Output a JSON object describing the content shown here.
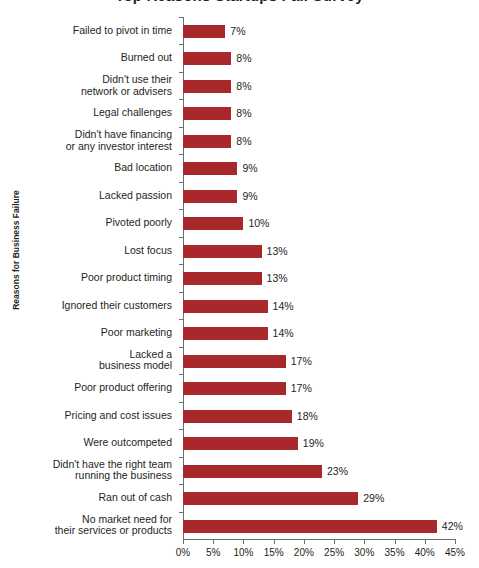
{
  "chart": {
    "title_fragment": "Top Reasons Startups Fail Survey",
    "y_axis_title": "Reasons for Business Failure",
    "bar_color": "#a8282b",
    "axis_color": "#6d6e71",
    "text_color": "#231f20"
  },
  "chart_data": {
    "type": "bar",
    "orientation": "horizontal",
    "title": "Top Reasons Startups Fail Survey",
    "xlabel": "",
    "ylabel": "Reasons for Business Failure",
    "xlim": [
      0,
      45
    ],
    "grid": false,
    "legend": null,
    "value_suffix": "%",
    "xticks": [
      0,
      5,
      10,
      15,
      20,
      25,
      30,
      35,
      40,
      45
    ],
    "xtick_labels": [
      "0%",
      "5%",
      "10%",
      "15%",
      "20%",
      "25%",
      "30%",
      "35%",
      "40%",
      "45%"
    ],
    "categories": [
      "Failed to pivot in time",
      "Burned out",
      "Didn't use their\nnetwork or advisers",
      "Legal challenges",
      "Didn't have financing\nor any investor interest",
      "Bad location",
      "Lacked passion",
      "Pivoted poorly",
      "Lost focus",
      "Poor product timing",
      "Ignored their customers",
      "Poor marketing",
      "Lacked a\nbusiness model",
      "Poor product offering",
      "Pricing and cost issues",
      "Were outcompeted",
      "Didn't have the right team\nrunning the business",
      "Ran out of cash",
      "No market need for\ntheir services or products"
    ],
    "values": [
      7,
      8,
      8,
      8,
      8,
      9,
      9,
      10,
      13,
      13,
      14,
      14,
      17,
      17,
      18,
      19,
      23,
      29,
      42
    ],
    "value_labels": [
      "7%",
      "8%",
      "8%",
      "8%",
      "8%",
      "9%",
      "9%",
      "10%",
      "13%",
      "13%",
      "14%",
      "14%",
      "17%",
      "17%",
      "18%",
      "19%",
      "23%",
      "29%",
      "42%"
    ]
  }
}
